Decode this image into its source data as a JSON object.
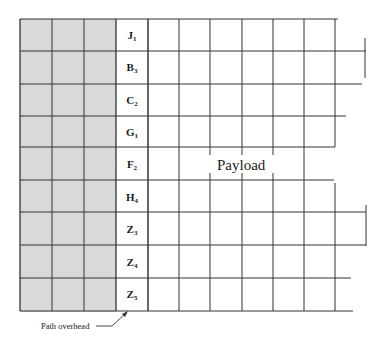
{
  "diagram": {
    "colors": {
      "overhead_fill": "#d9d9d9",
      "line": "#333333",
      "background": "#ffffff"
    },
    "rows": [
      {
        "letter": "J",
        "sub": "1"
      },
      {
        "letter": "B",
        "sub": "3"
      },
      {
        "letter": "C",
        "sub": "2"
      },
      {
        "letter": "G",
        "sub": "1"
      },
      {
        "letter": "F",
        "sub": "2"
      },
      {
        "letter": "H",
        "sub": "4"
      },
      {
        "letter": "Z",
        "sub": "3"
      },
      {
        "letter": "Z",
        "sub": "4"
      },
      {
        "letter": "Z",
        "sub": "5"
      }
    ],
    "shaded_columns": 3,
    "payload_label": "Payload",
    "callout_label": "Path overhead"
  }
}
